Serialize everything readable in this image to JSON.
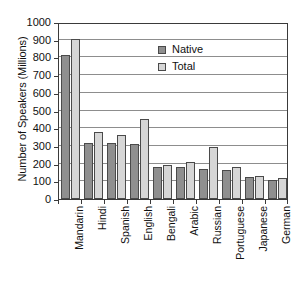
{
  "chart_data": {
    "type": "bar",
    "title": "",
    "xlabel": "",
    "ylabel": "Number of Speakers (Millions)",
    "ylim": [
      0,
      1000
    ],
    "ytick_step": 100,
    "yticks": [
      0,
      100,
      200,
      300,
      400,
      500,
      600,
      700,
      800,
      900,
      1000
    ],
    "ytick_labels": [
      "0",
      "100",
      "200",
      "300",
      "400",
      "500",
      "600",
      "700",
      "800",
      "900",
      "1000"
    ],
    "grid": true,
    "grid_axis": "y",
    "legend_position": "upper-center",
    "categories": [
      "Mandarin",
      "Hindi",
      "Spanish",
      "English",
      "Bengali",
      "Arabic",
      "Russian",
      "Portuguese",
      "Japanese",
      "German"
    ],
    "series": [
      {
        "name": "Native",
        "color": "#8f8f8f",
        "values": [
          815,
          315,
          315,
          310,
          181,
          180,
          170,
          165,
          125,
          105
        ]
      },
      {
        "name": "Total",
        "color": "#d6d6d6",
        "values": [
          905,
          380,
          360,
          450,
          195,
          210,
          295,
          180,
          128,
          120
        ]
      }
    ]
  },
  "legend": {
    "items": [
      {
        "label": "Native",
        "swatch": "native-swatch"
      },
      {
        "label": "Total",
        "swatch": "total-swatch"
      }
    ]
  },
  "colors": {
    "native": "#8f8f8f",
    "total": "#d6d6d6",
    "axis": "#3a3a3a",
    "gridline": "#8d8d8d",
    "background": "#ffffff",
    "text": "#111111"
  }
}
